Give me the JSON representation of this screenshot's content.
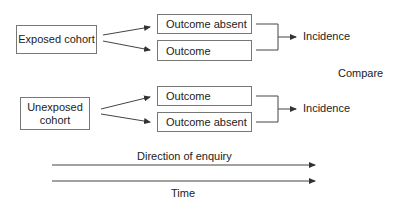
{
  "diagram": {
    "exposed_group": {
      "cohort_label": "Exposed cohort",
      "outcomes": [
        "Outcome absent",
        "Outcome"
      ],
      "result_label": "Incidence"
    },
    "unexposed_group": {
      "cohort_label_line1": "Unexposed",
      "cohort_label_line2": "cohort",
      "outcomes": [
        "Outcome",
        "Outcome absent"
      ],
      "result_label": "Incidence"
    },
    "compare_label": "Compare",
    "timeline": {
      "direction_label": "Direction of enquiry",
      "time_label": "Time"
    },
    "colors": {
      "line": "#444444",
      "box_border": "#777777",
      "text": "#222222"
    }
  }
}
